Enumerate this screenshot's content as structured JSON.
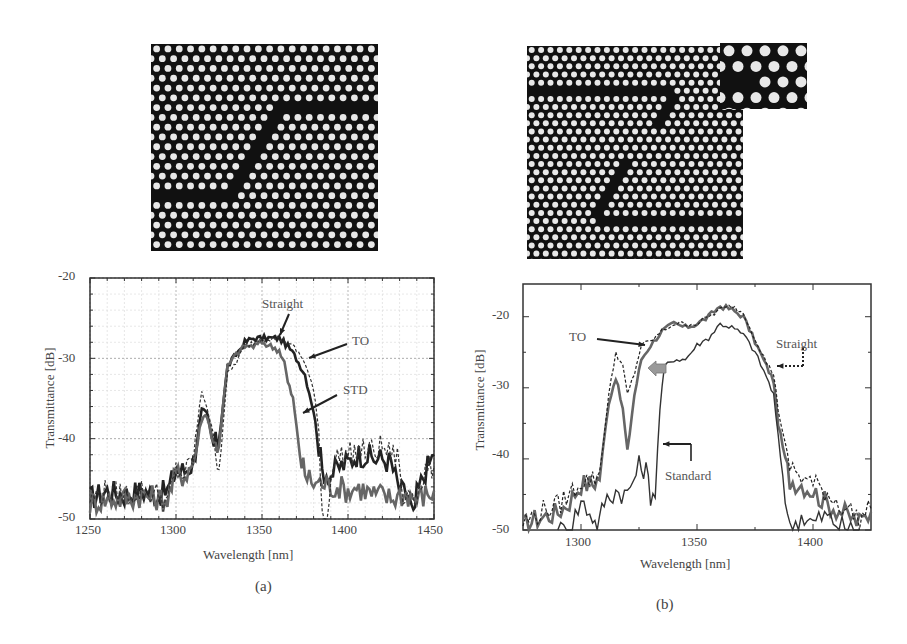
{
  "figure": {
    "panel_a": {
      "label": "(a)",
      "image": "photonic-crystal-waveguide-bend-smoothed",
      "xlabel": "Wavelength [nm]",
      "ylabel": "Transmittance [dB]",
      "xticks": [
        "1250",
        "1300",
        "1350",
        "1400",
        "1450"
      ],
      "yticks": [
        "-20",
        "-30",
        "-40",
        "-50"
      ],
      "annotations": [
        "Straight",
        "TO",
        "STD"
      ]
    },
    "panel_b": {
      "label": "(b)",
      "image": "photonic-crystal-60deg-bend-with-inset",
      "xlabel": "Wavelength [nm]",
      "ylabel": "Transmittance [dB]",
      "xticks": [
        "1300",
        "1350",
        "1400"
      ],
      "yticks": [
        "-20",
        "-30",
        "-40",
        "-50"
      ],
      "annotations": [
        "TO",
        "Straight",
        "Standard"
      ]
    }
  },
  "chart_data": [
    {
      "type": "line",
      "title": "(a)",
      "xlabel": "Wavelength [nm]",
      "ylabel": "Transmittance [dB]",
      "xlim": [
        1250,
        1450
      ],
      "ylim": [
        -50,
        -20
      ],
      "grid": true,
      "xticks": [
        1250,
        1300,
        1350,
        1400,
        1450
      ],
      "yticks": [
        -20,
        -30,
        -40,
        -50
      ],
      "series": [
        {
          "name": "Straight",
          "style": "dashed",
          "color": "#333333",
          "x": [
            1250,
            1260,
            1270,
            1280,
            1290,
            1295,
            1300,
            1305,
            1310,
            1315,
            1318,
            1322,
            1325,
            1330,
            1335,
            1340,
            1345,
            1350,
            1355,
            1360,
            1365,
            1370,
            1375,
            1380,
            1383,
            1385,
            1388,
            1390,
            1395,
            1400,
            1405,
            1410,
            1415,
            1420,
            1425,
            1430,
            1432,
            1435,
            1440,
            1445,
            1450
          ],
          "y": [
            -47.5,
            -46.5,
            -47,
            -46.5,
            -47,
            -48,
            -44,
            -44.5,
            -42.5,
            -34,
            -36,
            -40,
            -43.5,
            -32,
            -30.5,
            -28.5,
            -28,
            -27.5,
            -27.5,
            -27.5,
            -28,
            -29,
            -30.5,
            -34,
            -39,
            -49,
            -50,
            -44,
            -42,
            -42,
            -41.5,
            -41.5,
            -41.5,
            -41,
            -42,
            -42.5,
            -49,
            -46,
            -47,
            -44,
            -43.5
          ]
        },
        {
          "name": "TO",
          "style": "solid-thick",
          "color": "#222222",
          "x": [
            1250,
            1260,
            1270,
            1280,
            1290,
            1295,
            1300,
            1305,
            1310,
            1315,
            1318,
            1322,
            1325,
            1330,
            1335,
            1340,
            1345,
            1350,
            1355,
            1360,
            1365,
            1370,
            1375,
            1380,
            1383,
            1385,
            1390,
            1395,
            1400,
            1405,
            1410,
            1415,
            1420,
            1425,
            1430,
            1435,
            1438,
            1440,
            1445,
            1450
          ],
          "y": [
            -47.5,
            -46.5,
            -47,
            -46.5,
            -47,
            -46.5,
            -44,
            -44,
            -43,
            -36.5,
            -37,
            -41,
            -40,
            -31,
            -29.5,
            -28,
            -27.5,
            -27.5,
            -27.5,
            -27.5,
            -28.5,
            -30,
            -32,
            -36.5,
            -41,
            -44,
            -44.5,
            -43.5,
            -43,
            -42,
            -42,
            -42.5,
            -42.5,
            -43,
            -46.5,
            -47,
            -50,
            -47,
            -44,
            -42
          ]
        },
        {
          "name": "STD",
          "style": "solid-gray",
          "color": "#666666",
          "x": [
            1250,
            1260,
            1270,
            1280,
            1290,
            1295,
            1300,
            1305,
            1310,
            1315,
            1318,
            1322,
            1325,
            1330,
            1335,
            1340,
            1345,
            1350,
            1355,
            1360,
            1363,
            1365,
            1368,
            1370,
            1373,
            1375,
            1380,
            1385,
            1390,
            1395,
            1400,
            1405,
            1410,
            1415,
            1420,
            1425,
            1430,
            1435,
            1440,
            1445,
            1450
          ],
          "y": [
            -48,
            -47.5,
            -47.5,
            -47,
            -47.5,
            -47.5,
            -44.5,
            -44.5,
            -43,
            -37.5,
            -37,
            -41,
            -40.5,
            -31,
            -29.5,
            -28.5,
            -28.5,
            -28,
            -28.5,
            -29,
            -30.5,
            -33,
            -35,
            -38.5,
            -43,
            -44.5,
            -45.5,
            -45.5,
            -46,
            -46,
            -46.5,
            -46,
            -46.5,
            -47,
            -47,
            -47.5,
            -47,
            -47,
            -47.5,
            -47,
            -46.5
          ]
        }
      ],
      "annotations": [
        {
          "text": "Straight",
          "x": 1358,
          "y": -24.5,
          "arrow_to": [
            1362,
            -27.5
          ]
        },
        {
          "text": "TO",
          "x": 1400,
          "y": -28.5,
          "arrow_to": [
            1377,
            -30
          ]
        },
        {
          "text": "STD",
          "x": 1400,
          "y": -34.5,
          "arrow_to": [
            1372,
            -36.5
          ]
        }
      ]
    },
    {
      "type": "line",
      "title": "(b)",
      "xlabel": "Wavelength [nm]",
      "ylabel": "Transmittance [dB]",
      "xlim": [
        1275,
        1425
      ],
      "ylim": [
        -50,
        -15.5
      ],
      "grid": false,
      "xticks": [
        1300,
        1350,
        1400
      ],
      "yticks": [
        -20,
        -30,
        -40,
        -50
      ],
      "series": [
        {
          "name": "Straight",
          "style": "dashed",
          "color": "#222222",
          "x": [
            1275,
            1280,
            1285,
            1290,
            1295,
            1300,
            1305,
            1308,
            1312,
            1315,
            1318,
            1320,
            1323,
            1326,
            1330,
            1335,
            1340,
            1345,
            1350,
            1355,
            1360,
            1365,
            1370,
            1375,
            1380,
            1383,
            1385,
            1388,
            1390,
            1395,
            1400,
            1405,
            1410,
            1415,
            1420,
            1425
          ],
          "y": [
            -49,
            -48,
            -47,
            -46.5,
            -45,
            -43,
            -43,
            -42,
            -31,
            -25,
            -27,
            -31,
            -28,
            -24,
            -23.5,
            -22,
            -21,
            -21,
            -21,
            -20,
            -19,
            -18.5,
            -19.5,
            -23,
            -26.5,
            -28,
            -33,
            -38,
            -41,
            -42.5,
            -43.5,
            -44.5,
            -46,
            -47,
            -48.5,
            -47
          ]
        },
        {
          "name": "TO",
          "style": "solid-thick",
          "color": "#666666",
          "x": [
            1275,
            1280,
            1285,
            1290,
            1295,
            1300,
            1305,
            1308,
            1312,
            1315,
            1318,
            1320,
            1323,
            1326,
            1330,
            1335,
            1340,
            1345,
            1350,
            1355,
            1360,
            1365,
            1370,
            1375,
            1380,
            1383,
            1385,
            1388,
            1390,
            1395,
            1400,
            1405,
            1410,
            1415,
            1420,
            1425
          ],
          "y": [
            -49.5,
            -48.5,
            -48,
            -47.5,
            -46,
            -43.5,
            -43.5,
            -42.5,
            -32,
            -28.5,
            -33,
            -39,
            -31,
            -26,
            -24,
            -22,
            -21,
            -21.5,
            -21,
            -20,
            -18.5,
            -19,
            -20,
            -23.5,
            -27,
            -29,
            -35,
            -40,
            -43,
            -43.5,
            -44.5,
            -46,
            -47,
            -48,
            -49,
            -47.5
          ]
        },
        {
          "name": "Standard",
          "style": "solid-thin",
          "color": "#333333",
          "x": [
            1290,
            1295,
            1300,
            1305,
            1307,
            1310,
            1315,
            1320,
            1325,
            1328,
            1330,
            1332,
            1334,
            1336,
            1340,
            1345,
            1350,
            1355,
            1360,
            1365,
            1370,
            1375,
            1380,
            1383,
            1385,
            1388,
            1390,
            1395,
            1400,
            1405,
            1410,
            1415,
            1420
          ],
          "y": [
            -50,
            -50,
            -46,
            -48,
            -50,
            -46,
            -44.5,
            -45,
            -41,
            -41.5,
            -45,
            -44.5,
            -33,
            -27,
            -26,
            -26,
            -24,
            -23,
            -21,
            -21.5,
            -22.5,
            -25,
            -28.5,
            -31,
            -37,
            -45,
            -50,
            -48,
            -49,
            -48,
            -49,
            -50,
            -50
          ]
        }
      ],
      "annotations": [
        {
          "text": "TO",
          "x": 1308,
          "y": -23,
          "arrow_to": [
            1326,
            -24
          ]
        },
        {
          "text": "Straight",
          "x": 1397,
          "y": -24.5,
          "arrow_to": [
            1383,
            -27
          ]
        },
        {
          "text": "Standard",
          "x": 1343,
          "y": -43.5,
          "arrow_to": [
            1334,
            -37.5
          ]
        },
        {
          "text": "",
          "shape": "gray-block-arrow",
          "x": 1333,
          "y": -27.5,
          "points_to": "left"
        }
      ]
    }
  ]
}
